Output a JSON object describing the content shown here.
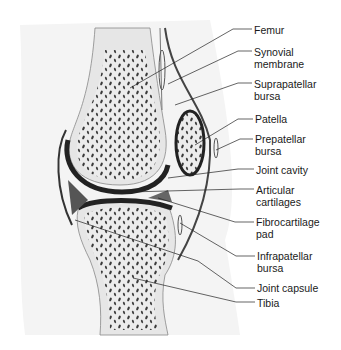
{
  "diagram": {
    "title": "",
    "labels": [
      {
        "id": "femur",
        "text": "Femur",
        "x": 254,
        "y": 24
      },
      {
        "id": "synovial-membrane",
        "text": "Synovial\nmembrane",
        "x": 254,
        "y": 46
      },
      {
        "id": "suprapatellar-bursa",
        "text": "Suprapatellar\nbursa",
        "x": 254,
        "y": 79
      },
      {
        "id": "patella",
        "text": "Patella",
        "x": 255,
        "y": 113
      },
      {
        "id": "prepatellar-bursa",
        "text": "Prepatellar\nbursa",
        "x": 255,
        "y": 133
      },
      {
        "id": "joint-cavity",
        "text": "Joint cavity",
        "x": 256,
        "y": 164
      },
      {
        "id": "articular-cartilages",
        "text": "Articular\ncartilages",
        "x": 256,
        "y": 184
      },
      {
        "id": "fibrocartilage-pad",
        "text": "Fibrocartilage\npad",
        "x": 256,
        "y": 216
      },
      {
        "id": "infrapatellar-bursa",
        "text": "Infrapatellar\nbursa",
        "x": 257,
        "y": 250
      },
      {
        "id": "joint-capsule",
        "text": "Joint capsule",
        "x": 257,
        "y": 280
      },
      {
        "id": "tibia",
        "text": "Tibia",
        "x": 257,
        "y": 299
      }
    ]
  }
}
